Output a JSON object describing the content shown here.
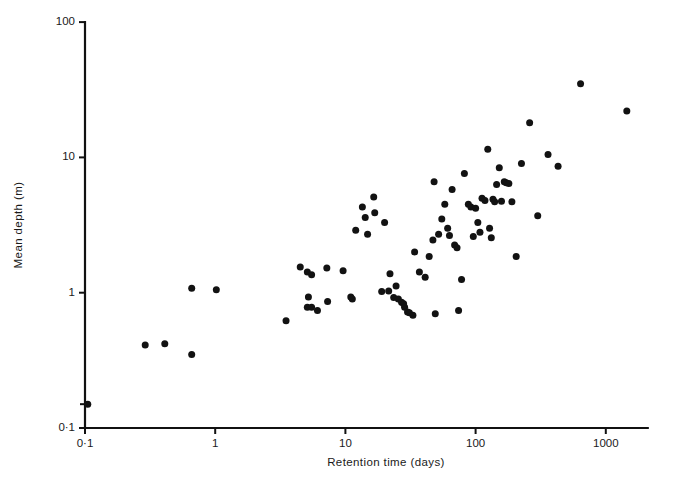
{
  "chart_data": {
    "type": "scatter",
    "title": "",
    "xlabel": "Retention time (days)",
    "ylabel": "Mean depth (m)",
    "xscale": "log",
    "yscale": "log",
    "xlim": [
      0.1,
      2100
    ],
    "ylim": [
      0.1,
      100
    ],
    "grid": false,
    "legend": null,
    "xticks": [
      0.1,
      1,
      10,
      100,
      1000
    ],
    "xtick_labels": [
      "0·1",
      "1",
      "10",
      "100",
      "1000"
    ],
    "yticks": [
      0.1,
      1,
      10,
      100
    ],
    "ytick_labels": [
      "0·1",
      "1",
      "10",
      "100"
    ],
    "y_minor_ticks": [
      0.15
    ],
    "marker": "filled-circle",
    "marker_color": "#121212",
    "marker_size_px": 4.6,
    "n_points": 84,
    "points": [
      {
        "x": 0.29,
        "y": 0.41
      },
      {
        "x": 0.41,
        "y": 0.42
      },
      {
        "x": 0.66,
        "y": 0.35
      },
      {
        "x": 0.66,
        "y": 1.08
      },
      {
        "x": 1.02,
        "y": 1.05
      },
      {
        "x": 3.5,
        "y": 0.62
      },
      {
        "x": 4.5,
        "y": 1.55
      },
      {
        "x": 5.1,
        "y": 1.42
      },
      {
        "x": 5.5,
        "y": 1.36
      },
      {
        "x": 5.2,
        "y": 0.93
      },
      {
        "x": 5.1,
        "y": 0.78
      },
      {
        "x": 5.5,
        "y": 0.78
      },
      {
        "x": 6.1,
        "y": 0.74
      },
      {
        "x": 7.2,
        "y": 1.52
      },
      {
        "x": 7.3,
        "y": 0.86
      },
      {
        "x": 9.6,
        "y": 1.45
      },
      {
        "x": 11.0,
        "y": 0.93
      },
      {
        "x": 11.3,
        "y": 0.9
      },
      {
        "x": 12.0,
        "y": 2.9
      },
      {
        "x": 13.5,
        "y": 4.3
      },
      {
        "x": 14.2,
        "y": 3.6
      },
      {
        "x": 14.8,
        "y": 2.7
      },
      {
        "x": 16.5,
        "y": 5.1
      },
      {
        "x": 16.8,
        "y": 3.9
      },
      {
        "x": 19.0,
        "y": 1.02
      },
      {
        "x": 20.0,
        "y": 3.3
      },
      {
        "x": 21.5,
        "y": 1.03
      },
      {
        "x": 22.0,
        "y": 1.38
      },
      {
        "x": 23.5,
        "y": 0.92
      },
      {
        "x": 24.5,
        "y": 1.12
      },
      {
        "x": 25.5,
        "y": 0.9
      },
      {
        "x": 27.0,
        "y": 0.85
      },
      {
        "x": 28.0,
        "y": 0.83
      },
      {
        "x": 28.5,
        "y": 0.78
      },
      {
        "x": 30.0,
        "y": 0.72
      },
      {
        "x": 31.0,
        "y": 0.71
      },
      {
        "x": 33.0,
        "y": 0.68
      },
      {
        "x": 34.0,
        "y": 2.0
      },
      {
        "x": 37.0,
        "y": 1.42
      },
      {
        "x": 41.0,
        "y": 1.3
      },
      {
        "x": 44.0,
        "y": 1.85
      },
      {
        "x": 47.0,
        "y": 2.45
      },
      {
        "x": 48.0,
        "y": 6.6
      },
      {
        "x": 52.0,
        "y": 2.7
      },
      {
        "x": 55.0,
        "y": 3.5
      },
      {
        "x": 58.0,
        "y": 4.5
      },
      {
        "x": 61.0,
        "y": 3.0
      },
      {
        "x": 63.0,
        "y": 2.65
      },
      {
        "x": 66.0,
        "y": 5.8
      },
      {
        "x": 69.0,
        "y": 2.25
      },
      {
        "x": 72.0,
        "y": 2.15
      },
      {
        "x": 74.0,
        "y": 0.74
      },
      {
        "x": 78.0,
        "y": 1.25
      },
      {
        "x": 82.0,
        "y": 7.6
      },
      {
        "x": 88.0,
        "y": 4.5
      },
      {
        "x": 92.0,
        "y": 4.3
      },
      {
        "x": 96.0,
        "y": 2.6
      },
      {
        "x": 100.0,
        "y": 4.2
      },
      {
        "x": 104.0,
        "y": 3.3
      },
      {
        "x": 108.0,
        "y": 2.8
      },
      {
        "x": 112.0,
        "y": 5.0
      },
      {
        "x": 118.0,
        "y": 4.8
      },
      {
        "x": 124.0,
        "y": 11.5
      },
      {
        "x": 128.0,
        "y": 3.0
      },
      {
        "x": 132.0,
        "y": 2.55
      },
      {
        "x": 136.0,
        "y": 4.9
      },
      {
        "x": 140.0,
        "y": 4.7
      },
      {
        "x": 145.0,
        "y": 6.3
      },
      {
        "x": 152.0,
        "y": 8.4
      },
      {
        "x": 158.0,
        "y": 4.75
      },
      {
        "x": 166.0,
        "y": 6.6
      },
      {
        "x": 172.0,
        "y": 6.5
      },
      {
        "x": 180.0,
        "y": 6.4
      },
      {
        "x": 190.0,
        "y": 4.7
      },
      {
        "x": 205.0,
        "y": 1.85
      },
      {
        "x": 225.0,
        "y": 9.0
      },
      {
        "x": 260.0,
        "y": 18.0
      },
      {
        "x": 300.0,
        "y": 3.7
      },
      {
        "x": 360.0,
        "y": 10.5
      },
      {
        "x": 430.0,
        "y": 8.6
      },
      {
        "x": 640.0,
        "y": 35.0
      },
      {
        "x": 1450.0,
        "y": 22.0
      },
      {
        "x": 0.105,
        "y": 0.15
      },
      {
        "x": 49.0,
        "y": 0.7
      }
    ]
  }
}
